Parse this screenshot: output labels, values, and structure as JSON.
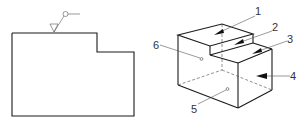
{
  "figure": {
    "left_view": {
      "description": "2D front view outline with surface symbol",
      "surface_symbol": "surface-finish-triangle-with-leader"
    },
    "right_view": {
      "description": "Isometric stepped block with numbered surfaces",
      "labels": [
        {
          "id": "1",
          "text": "1"
        },
        {
          "id": "2",
          "text": "2"
        },
        {
          "id": "3",
          "text": "3"
        },
        {
          "id": "4",
          "text": "4"
        },
        {
          "id": "5",
          "text": "5"
        },
        {
          "id": "6",
          "text": "6"
        }
      ]
    }
  }
}
